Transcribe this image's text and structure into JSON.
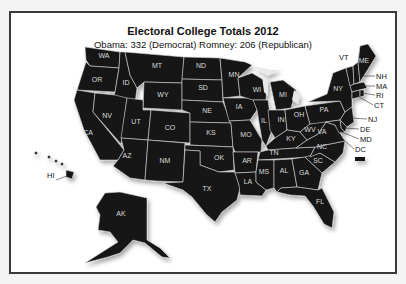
{
  "title": "Electoral College Totals 2012",
  "subtitle": "Obama: 332 (Democrat) Romney: 206 (Republican)",
  "colors": {
    "state_fill": "#141214",
    "border": "#d8d8d8",
    "frame": "#3a3a3a"
  },
  "states": [
    {
      "abbr": "WA",
      "lx": 104,
      "ly": 58
    },
    {
      "abbr": "OR",
      "lx": 97,
      "ly": 82
    },
    {
      "abbr": "CA",
      "lx": 88,
      "ly": 135
    },
    {
      "abbr": "ID",
      "lx": 126,
      "ly": 85
    },
    {
      "abbr": "NV",
      "lx": 107,
      "ly": 118
    },
    {
      "abbr": "MT",
      "lx": 157,
      "ly": 68
    },
    {
      "abbr": "WY",
      "lx": 163,
      "ly": 97
    },
    {
      "abbr": "UT",
      "lx": 136,
      "ly": 124
    },
    {
      "abbr": "AZ",
      "lx": 127,
      "ly": 158
    },
    {
      "abbr": "CO",
      "lx": 170,
      "ly": 130
    },
    {
      "abbr": "NM",
      "lx": 165,
      "ly": 163
    },
    {
      "abbr": "ND",
      "lx": 201,
      "ly": 68
    },
    {
      "abbr": "SD",
      "lx": 203,
      "ly": 90
    },
    {
      "abbr": "NE",
      "lx": 207,
      "ly": 113
    },
    {
      "abbr": "KS",
      "lx": 211,
      "ly": 135
    },
    {
      "abbr": "OK",
      "lx": 219,
      "ly": 160
    },
    {
      "abbr": "TX",
      "lx": 207,
      "ly": 191
    },
    {
      "abbr": "MN",
      "lx": 234,
      "ly": 77
    },
    {
      "abbr": "IA",
      "lx": 239,
      "ly": 109
    },
    {
      "abbr": "MO",
      "lx": 246,
      "ly": 137
    },
    {
      "abbr": "AR",
      "lx": 247,
      "ly": 163
    },
    {
      "abbr": "LA",
      "lx": 248,
      "ly": 184
    },
    {
      "abbr": "WI",
      "lx": 257,
      "ly": 92
    },
    {
      "abbr": "IL",
      "lx": 264,
      "ly": 123
    },
    {
      "abbr": "MI",
      "lx": 283,
      "ly": 97
    },
    {
      "abbr": "IN",
      "lx": 281,
      "ly": 122
    },
    {
      "abbr": "OH",
      "lx": 299,
      "ly": 117
    },
    {
      "abbr": "KY",
      "lx": 291,
      "ly": 141
    },
    {
      "abbr": "TN",
      "lx": 274,
      "ly": 155
    },
    {
      "abbr": "MS",
      "lx": 264,
      "ly": 174
    },
    {
      "abbr": "AL",
      "lx": 284,
      "ly": 173
    },
    {
      "abbr": "GA",
      "lx": 304,
      "ly": 175
    },
    {
      "abbr": "FL",
      "lx": 320,
      "ly": 204
    },
    {
      "abbr": "SC",
      "lx": 318,
      "ly": 163
    },
    {
      "abbr": "NC",
      "lx": 322,
      "ly": 149
    },
    {
      "abbr": "VA",
      "lx": 322,
      "ly": 134
    },
    {
      "abbr": "WV",
      "lx": 310,
      "ly": 132
    },
    {
      "abbr": "PA",
      "lx": 324,
      "ly": 112
    },
    {
      "abbr": "NY",
      "lx": 338,
      "ly": 91
    },
    {
      "abbr": "ME",
      "lx": 364,
      "ly": 63
    },
    {
      "abbr": "AK",
      "lx": 121,
      "ly": 216
    },
    {
      "abbr": "HI",
      "lx": 47,
      "ly": 178
    }
  ],
  "callouts": [
    {
      "abbr": "VT",
      "x": 339,
      "y": 60
    },
    {
      "abbr": "NH",
      "x": 376,
      "ly": 0,
      "y": 79
    },
    {
      "abbr": "MA",
      "x": 376,
      "y": 89
    },
    {
      "abbr": "RI",
      "x": 376,
      "y": 98
    },
    {
      "abbr": "CT",
      "x": 374,
      "y": 108
    },
    {
      "abbr": "NJ",
      "x": 368,
      "y": 122
    },
    {
      "abbr": "DE",
      "x": 360,
      "y": 132
    },
    {
      "abbr": "MD",
      "x": 360,
      "y": 142
    },
    {
      "abbr": "DC",
      "x": 355,
      "y": 152
    }
  ]
}
